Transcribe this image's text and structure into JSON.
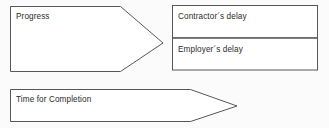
{
  "diagram": {
    "type": "flow-arrow-diagram",
    "background_color": "#fbfbfb",
    "line_color": "#575757",
    "text_color": "#2b2b2b",
    "shapes": [
      {
        "id": "progress",
        "kind": "right-arrow",
        "label": "Progress"
      },
      {
        "id": "contractors-delay",
        "kind": "rectangle",
        "label": "Contractor´s delay"
      },
      {
        "id": "employers-delay",
        "kind": "rectangle",
        "label": "Employer´s delay"
      },
      {
        "id": "time-for-completion",
        "kind": "right-arrow",
        "label": "Time for Completion"
      }
    ]
  }
}
